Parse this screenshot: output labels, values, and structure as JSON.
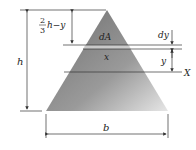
{
  "diagram": {
    "labels": {
      "height": "h",
      "base": "b",
      "top_distance_num": "2",
      "top_distance_den": "3",
      "top_distance_rest": "h−y",
      "element_area": "dA",
      "element_width": "x",
      "element_thickness": "dy",
      "element_position": "y",
      "axis": "X"
    },
    "colors": {
      "triangle_light": "#c8c8c8",
      "triangle_dark": "#7a7a7a",
      "strip": "#d9d9d9",
      "line": "#333333"
    }
  }
}
